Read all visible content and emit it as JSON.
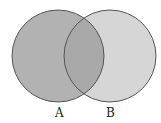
{
  "diagram": {
    "type": "venn",
    "sets": [
      {
        "label": "A",
        "fill": "#b2b2b2",
        "stroke": "#555555"
      },
      {
        "label": "B",
        "fill": "#d6d6d6",
        "stroke": "#555555"
      }
    ],
    "intersection_fill": "#a9a9a9"
  }
}
